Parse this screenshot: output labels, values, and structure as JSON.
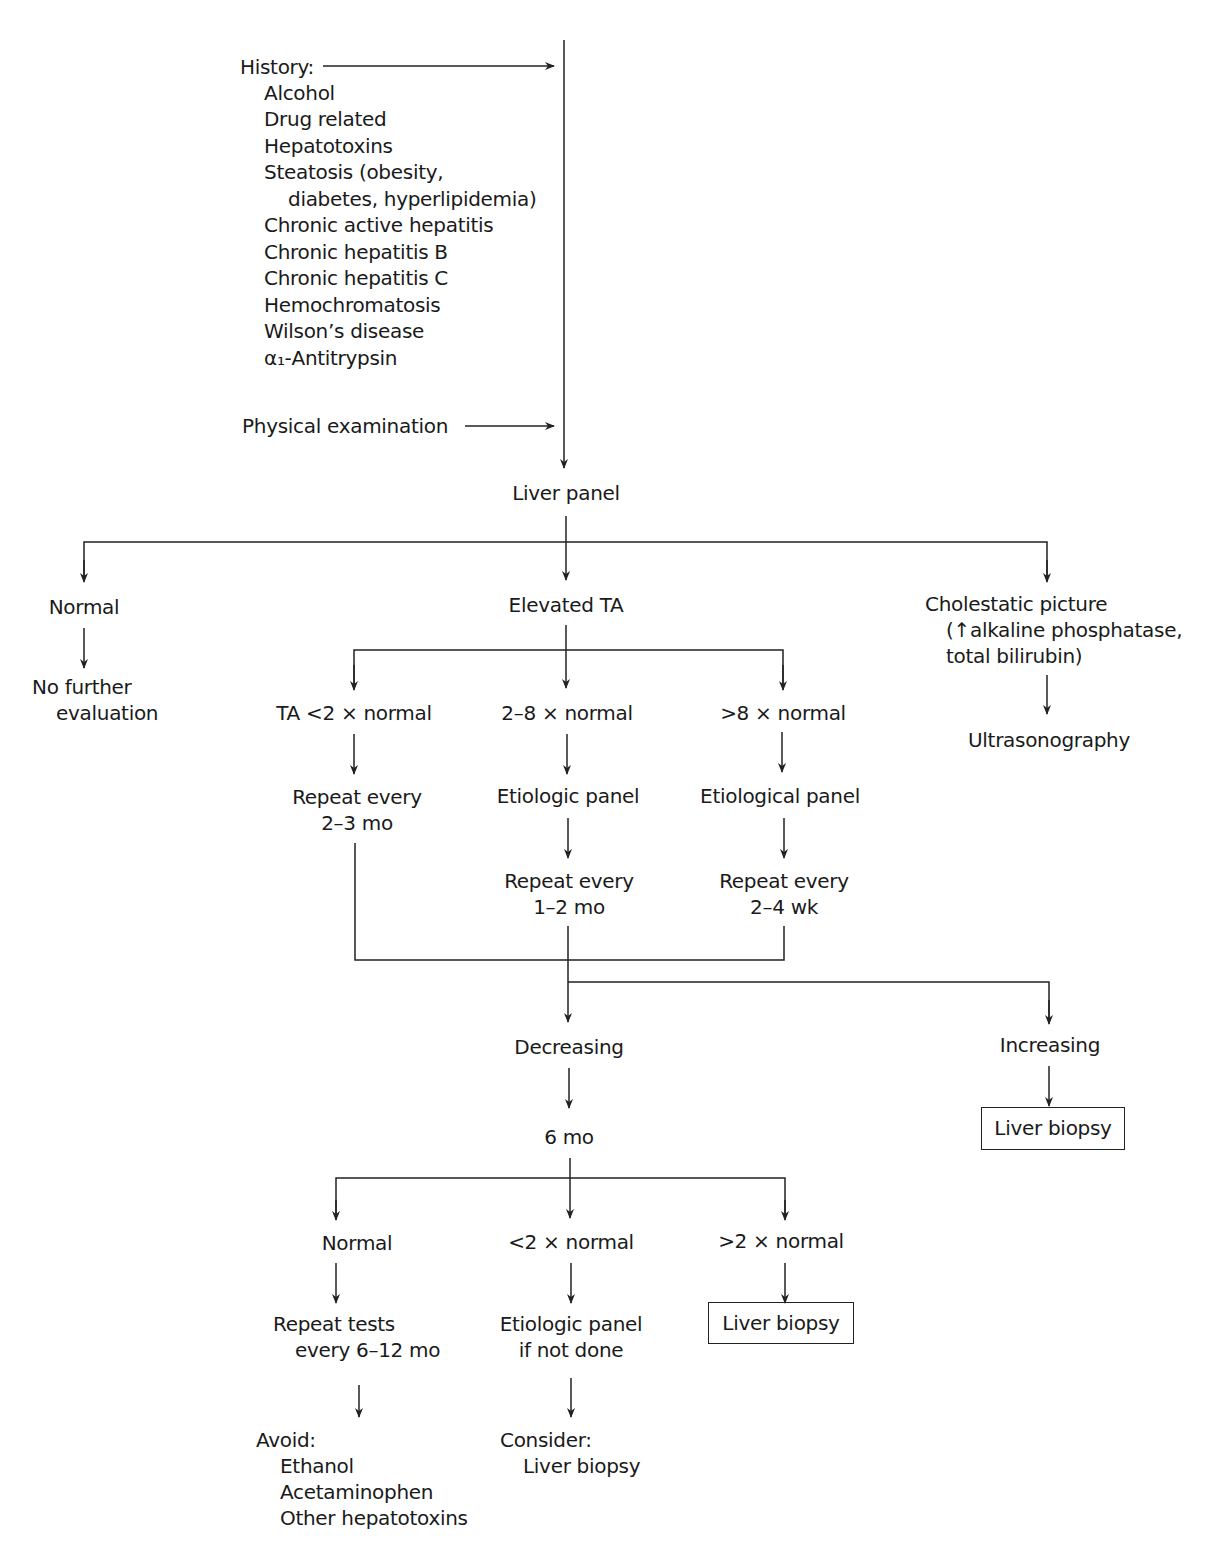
{
  "history": {
    "label": "History:",
    "items": [
      "Alcohol",
      "Drug related",
      "Hepatotoxins",
      "Steatosis (obesity,",
      "diabetes, hyperlipidemia)",
      "Chronic active hepatitis",
      "Chronic hepatitis B",
      "Chronic hepatitis C",
      "Hemochromatosis",
      "Wilson’s disease",
      "α₁-Antitrypsin"
    ]
  },
  "physical_exam": "Physical examination",
  "liver_panel": "Liver panel",
  "level1": {
    "normal": "Normal",
    "no_further": [
      "No further",
      "evaluation"
    ],
    "elevated_ta": "Elevated TA",
    "cholestatic": [
      "Cholestatic picture",
      "(↑alkaline phosphatase,",
      "total bilirubin)"
    ],
    "ultrasonography": "Ultrasonography"
  },
  "elevated_branches": {
    "lt2": {
      "label": "TA <2 × normal",
      "next": [
        "Repeat every",
        "2–3 mo"
      ]
    },
    "mid": {
      "label": "2–8 × normal",
      "panel": "Etiologic panel",
      "next": [
        "Repeat every",
        "1–2 mo"
      ]
    },
    "gt8": {
      "label": ">8 × normal",
      "panel": "Etiological panel",
      "next": [
        "Repeat every",
        "2–4 wk"
      ]
    }
  },
  "trend": {
    "decreasing": "Decreasing",
    "increasing": "Increasing",
    "increasing_action": "Liver biopsy",
    "six_mo": "6 mo"
  },
  "six_mo_branches": {
    "normal": {
      "label": "Normal",
      "next": [
        "Repeat tests",
        "every 6–12 mo"
      ],
      "avoid_label": "Avoid:",
      "avoid_items": [
        "Ethanol",
        "Acetaminophen",
        "Other hepatotoxins"
      ]
    },
    "lt2": {
      "label": "<2 × normal",
      "next": [
        "Etiologic panel",
        "if not done"
      ],
      "consider_label": "Consider:",
      "consider_item": "Liver biopsy"
    },
    "gt2": {
      "label": ">2 × normal",
      "action": "Liver biopsy"
    }
  },
  "colors": {
    "line": "#222222",
    "text": "#1a1a1a",
    "background": "#ffffff"
  }
}
